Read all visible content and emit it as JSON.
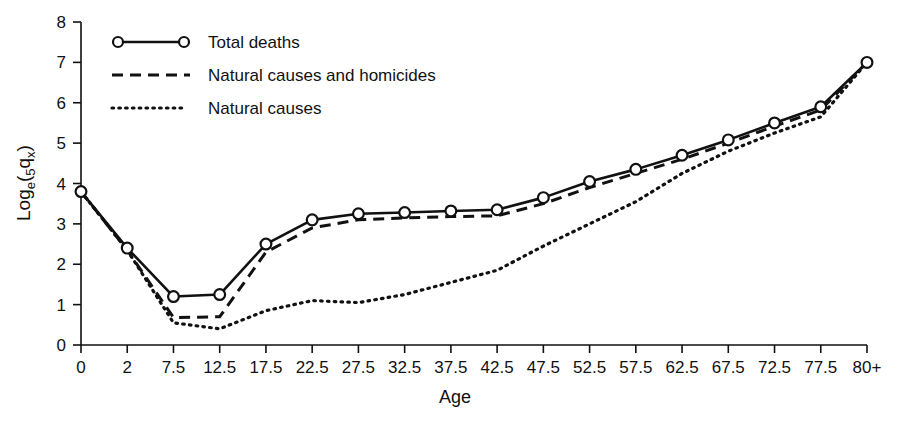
{
  "chart_data": {
    "type": "line",
    "title": "",
    "xlabel": "Age",
    "ylabel": "Log_e(5q_x)",
    "ylabel_parts": {
      "main_1": "Log",
      "sub_1": "e",
      "main_2": "(",
      "sub_2": "5",
      "main_3": "q",
      "sub_3": "x",
      "main_4": ")"
    },
    "categories": [
      "0",
      "2",
      "7.5",
      "12.5",
      "17.5",
      "22.5",
      "27.5",
      "32.5",
      "37.5",
      "42.5",
      "47.5",
      "52.5",
      "57.5",
      "62.5",
      "67.5",
      "72.5",
      "77.5",
      "80+"
    ],
    "xtick_labels": [
      "0",
      "2",
      "7.5",
      "12.5",
      "17.5",
      "22.5",
      "27.5",
      "32.5",
      "37.5",
      "42.5",
      "47.5",
      "52.5",
      "57.5",
      "62.5",
      "67.5",
      "72.5",
      "77.5",
      "80+"
    ],
    "ytick_labels": [
      "0",
      "1",
      "2",
      "3",
      "4",
      "5",
      "6",
      "7",
      "8"
    ],
    "ylim": [
      0,
      8
    ],
    "grid": false,
    "legend_position": "top-left",
    "series": [
      {
        "name": "Total deaths",
        "style": "solid-with-circle-markers",
        "markers": true,
        "values": [
          3.8,
          2.4,
          1.2,
          1.25,
          2.5,
          3.1,
          3.25,
          3.28,
          3.32,
          3.35,
          3.65,
          4.05,
          4.35,
          4.7,
          5.08,
          5.5,
          5.9,
          7.0
        ]
      },
      {
        "name": "Natural causes and homicides",
        "style": "dashed",
        "markers": false,
        "values": [
          3.8,
          2.35,
          0.68,
          0.7,
          2.3,
          2.9,
          3.1,
          3.15,
          3.18,
          3.2,
          3.5,
          3.9,
          4.25,
          4.6,
          5.0,
          5.42,
          5.82,
          7.0
        ]
      },
      {
        "name": "Natural causes",
        "style": "dotted",
        "markers": false,
        "values": [
          3.8,
          2.35,
          0.55,
          0.4,
          0.85,
          1.1,
          1.05,
          1.25,
          1.55,
          1.85,
          2.45,
          3.0,
          3.55,
          4.25,
          4.8,
          5.25,
          5.65,
          7.0
        ]
      }
    ],
    "legend": [
      {
        "label": "Total deaths",
        "style": "solid-with-circle-markers"
      },
      {
        "label": "Natural causes and homicides",
        "style": "dashed"
      },
      {
        "label": "Natural causes",
        "style": "dotted"
      }
    ],
    "colors": {
      "line": "#111111",
      "marker_fill": "#ffffff",
      "background": "#ffffff"
    }
  }
}
